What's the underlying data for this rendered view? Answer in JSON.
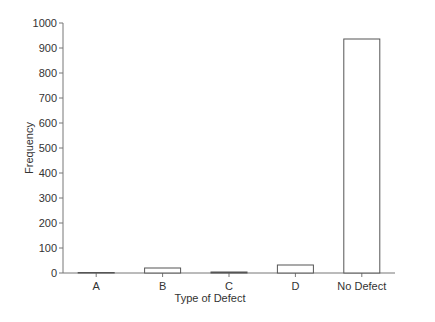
{
  "chart_data": {
    "type": "bar",
    "title": "",
    "xlabel": "Type of Defect",
    "ylabel": "Frequency",
    "categories": [
      "A",
      "B",
      "C",
      "D",
      "No Defect"
    ],
    "values": [
      2,
      20,
      4,
      32,
      936
    ],
    "ylim": [
      0,
      1000
    ],
    "yticks": [
      0,
      100,
      200,
      300,
      400,
      500,
      600,
      700,
      800,
      900,
      1000
    ],
    "grid": false,
    "legend": null,
    "bar_fill": "#ffffff",
    "bar_stroke": "#555555"
  }
}
